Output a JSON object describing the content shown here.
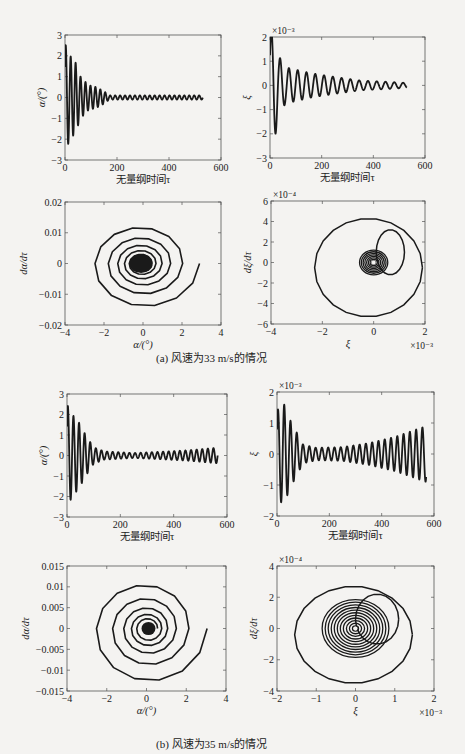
{
  "captions": {
    "a": "(a) 风速为33 m/s的情况",
    "b": "(b) 风速为35 m/s的情况"
  },
  "chart_data": [
    {
      "id": "a-alpha-time",
      "type": "line",
      "title": "",
      "xlabel": "无量纲时间τ",
      "ylabel": "α/(°)",
      "xlim": [
        0,
        600
      ],
      "ylim": [
        -3,
        3
      ],
      "xticks": [
        0,
        200,
        400,
        600
      ],
      "yticks": [
        -3,
        -2,
        -1,
        0,
        1,
        2,
        3
      ],
      "exponent_label": "",
      "frame": {
        "x": 65,
        "y": 35,
        "w": 156,
        "h": 125
      },
      "signal": {
        "t_end": 530,
        "period": 19,
        "envelope": [
          [
            0,
            2.6
          ],
          [
            20,
            2.0
          ],
          [
            40,
            1.7
          ],
          [
            60,
            1.0
          ],
          [
            90,
            0.6
          ],
          [
            120,
            0.5
          ],
          [
            150,
            0.3
          ],
          [
            170,
            0.1
          ],
          [
            530,
            0.1
          ]
        ]
      }
    },
    {
      "id": "a-xi-time",
      "type": "line",
      "title": "",
      "xlabel": "无量纲时间τ",
      "ylabel": "ξ",
      "xlim": [
        0,
        600
      ],
      "ylim": [
        -3,
        2
      ],
      "xticks": [
        0,
        200,
        400,
        600
      ],
      "yticks": [
        -3,
        -2,
        -1,
        0,
        1,
        2
      ],
      "exponent_label": "×10⁻³",
      "frame": {
        "x": 270,
        "y": 37,
        "w": 155,
        "h": 121
      },
      "signal": {
        "t_end": 530,
        "period": 34,
        "envelope": [
          [
            0,
            2.2
          ],
          [
            15,
            2.4
          ],
          [
            35,
            1.2
          ],
          [
            60,
            0.75
          ],
          [
            100,
            0.65
          ],
          [
            160,
            0.5
          ],
          [
            250,
            0.35
          ],
          [
            350,
            0.2
          ],
          [
            450,
            0.15
          ],
          [
            530,
            0.1
          ]
        ]
      }
    },
    {
      "id": "a-alpha-phase",
      "type": "line",
      "title": "",
      "xlabel": "α/(°)",
      "ylabel": "dα/dτ",
      "xlim": [
        -4,
        4
      ],
      "ylim": [
        -0.02,
        0.02
      ],
      "xticks": [
        -4,
        -2,
        0,
        2,
        4
      ],
      "yticks": [
        -0.02,
        -0.01,
        0,
        0.01,
        0.02
      ],
      "ytick_labels": [
        "−0.02",
        "−0.01",
        "0",
        "0.01",
        "0.02"
      ],
      "exponent_label": "",
      "frame": {
        "x": 65,
        "y": 202,
        "w": 156,
        "h": 123
      },
      "spiral": {
        "start_r": 2.9,
        "turns": 5,
        "decay": 0.55,
        "ratio": 0.0052,
        "offset_x": -0.1,
        "core": true,
        "core_r": 0.6
      }
    },
    {
      "id": "a-xi-phase",
      "type": "line",
      "title": "",
      "xlabel": "ξ",
      "ylabel": "dξ/dτ",
      "xlim": [
        -4,
        2
      ],
      "ylim": [
        -6,
        6
      ],
      "xticks": [
        -4,
        -2,
        0,
        2
      ],
      "yticks": [
        -6,
        -4,
        -2,
        0,
        2,
        4,
        6
      ],
      "exponent_label": "×10⁻⁴",
      "x_exponent_label": "×10⁻³",
      "frame": {
        "x": 271,
        "y": 201,
        "w": 154,
        "h": 123
      },
      "loops": [
        {
          "cx": -0.2,
          "cy": -0.5,
          "rx": 2.1,
          "ry": 4.8
        },
        {
          "cx": 0.65,
          "cy": 1.0,
          "rx": 0.55,
          "ry": 2.2
        }
      ],
      "core": {
        "cx": 0,
        "cy": 0,
        "rx": 0.55,
        "ry": 1.2,
        "rings": 8
      }
    },
    {
      "id": "b-alpha-time",
      "type": "line",
      "title": "",
      "xlabel": "无量纲时间τ",
      "ylabel": "α/(°)",
      "xlim": [
        0,
        600
      ],
      "ylim": [
        -3,
        3
      ],
      "xticks": [
        0,
        200,
        400,
        600
      ],
      "yticks": [
        -3,
        -2,
        -1,
        0,
        1,
        2,
        3
      ],
      "exponent_label": "",
      "frame": {
        "x": 67,
        "y": 394,
        "w": 160,
        "h": 123
      },
      "signal": {
        "t_end": 565,
        "period": 21,
        "envelope": [
          [
            0,
            2.5
          ],
          [
            20,
            2.0
          ],
          [
            45,
            1.6
          ],
          [
            70,
            1.0
          ],
          [
            100,
            0.4
          ],
          [
            140,
            0.2
          ],
          [
            250,
            0.12
          ],
          [
            350,
            0.18
          ],
          [
            450,
            0.25
          ],
          [
            565,
            0.38
          ]
        ]
      }
    },
    {
      "id": "b-xi-time",
      "type": "line",
      "title": "",
      "xlabel": "无量纲时间τ",
      "ylabel": "ξ",
      "xlim": [
        0,
        600
      ],
      "ylim": [
        -2,
        2
      ],
      "xticks": [
        0,
        200,
        400,
        600
      ],
      "yticks": [
        -2,
        -1,
        0,
        1,
        2
      ],
      "exponent_label": "×10⁻³",
      "frame": {
        "x": 277,
        "y": 392,
        "w": 157,
        "h": 124
      },
      "signal": {
        "t_end": 570,
        "period": 24,
        "envelope": [
          [
            0,
            1.4
          ],
          [
            25,
            1.65
          ],
          [
            50,
            1.1
          ],
          [
            75,
            0.7
          ],
          [
            100,
            0.3
          ],
          [
            150,
            0.2
          ],
          [
            250,
            0.22
          ],
          [
            350,
            0.35
          ],
          [
            450,
            0.55
          ],
          [
            570,
            0.9
          ]
        ]
      }
    },
    {
      "id": "b-alpha-phase",
      "type": "line",
      "title": "",
      "xlabel": "α/(°)",
      "ylabel": "dα/dτ",
      "xlim": [
        -4,
        4
      ],
      "ylim": [
        -0.015,
        0.015
      ],
      "xticks": [
        -4,
        -2,
        0,
        2,
        4
      ],
      "yticks": [
        -0.015,
        -0.01,
        -0.005,
        0,
        0.005,
        0.01,
        0.015
      ],
      "ytick_labels": [
        "−0.015",
        "−0.01",
        "−0.005",
        "0",
        "0.005",
        "0.01",
        "0.015"
      ],
      "exponent_label": "",
      "frame": {
        "x": 67,
        "y": 566,
        "w": 159,
        "h": 125
      },
      "spiral": {
        "start_r": 3.05,
        "turns": 5,
        "decay": 0.6,
        "ratio": 0.0045,
        "offset_x": 0.1,
        "core": true,
        "core_r": 0.35
      }
    },
    {
      "id": "b-xi-phase",
      "type": "line",
      "title": "",
      "xlabel": "ξ",
      "ylabel": "dξ/dτ",
      "xlim": [
        -2,
        2
      ],
      "ylim": [
        -4,
        4
      ],
      "xticks": [
        -2,
        -1,
        0,
        1,
        2
      ],
      "yticks": [
        -4,
        -2,
        0,
        2,
        4
      ],
      "exponent_label": "×10⁻⁴",
      "x_exponent_label": "×10⁻³",
      "frame": {
        "x": 277,
        "y": 566,
        "w": 157,
        "h": 125
      },
      "loops": [
        {
          "cx": -0.05,
          "cy": -0.4,
          "rx": 1.5,
          "ry": 3.1
        },
        {
          "cx": 0.55,
          "cy": 0.6,
          "rx": 0.55,
          "ry": 1.6
        }
      ],
      "core": {
        "cx": 0,
        "cy": 0,
        "rx": 0.85,
        "ry": 1.85,
        "rings": 11
      }
    }
  ]
}
